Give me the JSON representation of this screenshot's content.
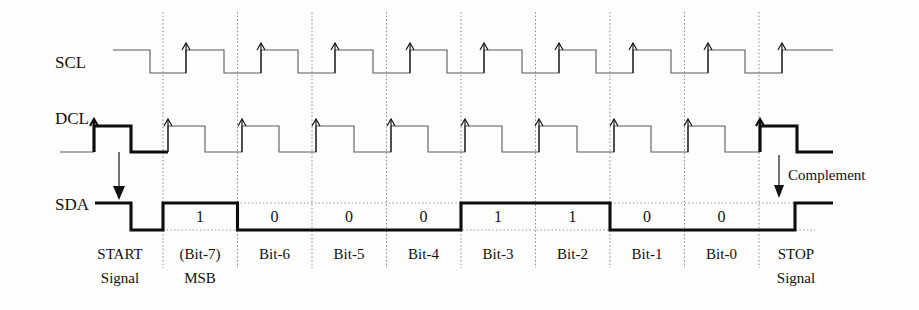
{
  "diagram": {
    "signals": [
      {
        "id": "scl",
        "label": "SCL"
      },
      {
        "id": "dcl",
        "label": "DCL"
      },
      {
        "id": "sda",
        "label": "SDA"
      }
    ],
    "annotations": {
      "start": {
        "line1": "START",
        "line2": "Signal"
      },
      "stop": {
        "line1": "STOP",
        "line2": "Signal"
      },
      "complement": "Complement"
    },
    "bits": [
      {
        "name": "(Bit-7)",
        "name2": "MSB",
        "value": "1"
      },
      {
        "name": "Bit-6",
        "name2": "",
        "value": "0"
      },
      {
        "name": "Bit-5",
        "name2": "",
        "value": "0"
      },
      {
        "name": "Bit-4",
        "name2": "",
        "value": "0"
      },
      {
        "name": "Bit-3",
        "name2": "",
        "value": "1"
      },
      {
        "name": "Bit-2",
        "name2": "",
        "value": "1"
      },
      {
        "name": "Bit-1",
        "name2": "",
        "value": "0"
      },
      {
        "name": "Bit-0",
        "name2": "",
        "value": "0"
      }
    ],
    "colors": {
      "thin_trace": "#5a5a5a",
      "bold_trace": "#0d0d0d",
      "grid": "#8d8d8d",
      "background": "#fdfdfc"
    },
    "geometry": {
      "grid_x": [
        163,
        237.5,
        312,
        386.5,
        461,
        535.5,
        610,
        684.5,
        759
      ],
      "scl_high_y": 50,
      "scl_low_y": 73,
      "dcl_high_y": 126,
      "dcl_low_y": 152,
      "sda_high_y": 203,
      "sda_low_y": 230
    }
  }
}
